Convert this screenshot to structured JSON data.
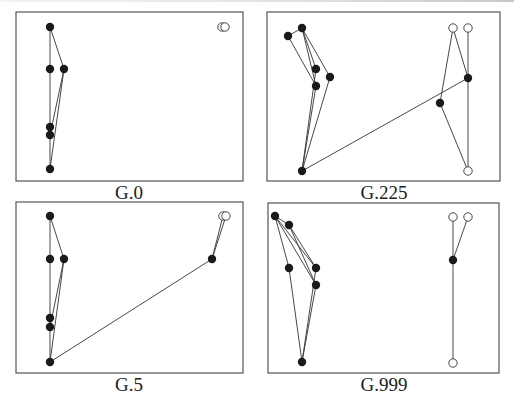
{
  "figure": {
    "panels": [
      {
        "id": "g0",
        "label": "G.0",
        "frame": [
          16,
          12,
          243,
          181
        ],
        "label_pos": [
          69,
          182
        ],
        "filled_nodes": [
          [
            50,
            27
          ],
          [
            50,
            69
          ],
          [
            64,
            69
          ],
          [
            50,
            127
          ],
          [
            50,
            135
          ],
          [
            50,
            169
          ]
        ],
        "open_nodes": [
          [
            222,
            27
          ],
          [
            225,
            27
          ]
        ],
        "edges": [
          [
            [
              50,
              27
            ],
            [
              50,
              69
            ]
          ],
          [
            [
              50,
              69
            ],
            [
              50,
              127
            ]
          ],
          [
            [
              50,
              127
            ],
            [
              50,
              135
            ]
          ],
          [
            [
              50,
              135
            ],
            [
              50,
              169
            ]
          ],
          [
            [
              50,
              27
            ],
            [
              64,
              69
            ]
          ],
          [
            [
              64,
              69
            ],
            [
              50,
              135
            ]
          ],
          [
            [
              64,
              69
            ],
            [
              50,
              169
            ]
          ]
        ]
      },
      {
        "id": "g225",
        "label": "G.225",
        "frame": [
          267,
          12,
          500,
          181
        ],
        "label_pos": [
          324,
          182
        ],
        "filled_nodes": [
          [
            302,
            28
          ],
          [
            288,
            36
          ],
          [
            316,
            69
          ],
          [
            330,
            77
          ],
          [
            316,
            86
          ],
          [
            302,
            171
          ],
          [
            468,
            78
          ],
          [
            440,
            103
          ]
        ],
        "open_nodes": [
          [
            453,
            28
          ],
          [
            468,
            28
          ],
          [
            468,
            171
          ]
        ],
        "edges": [
          [
            [
              302,
              28
            ],
            [
              288,
              36
            ]
          ],
          [
            [
              288,
              36
            ],
            [
              316,
              86
            ]
          ],
          [
            [
              302,
              28
            ],
            [
              316,
              69
            ]
          ],
          [
            [
              302,
              28
            ],
            [
              316,
              86
            ]
          ],
          [
            [
              302,
              28
            ],
            [
              330,
              77
            ]
          ],
          [
            [
              316,
              69
            ],
            [
              302,
              171
            ]
          ],
          [
            [
              316,
              86
            ],
            [
              302,
              171
            ]
          ],
          [
            [
              330,
              77
            ],
            [
              302,
              171
            ]
          ],
          [
            [
              302,
              171
            ],
            [
              468,
              78
            ]
          ],
          [
            [
              453,
              28
            ],
            [
              468,
              78
            ]
          ],
          [
            [
              453,
              28
            ],
            [
              440,
              103
            ]
          ],
          [
            [
              468,
              28
            ],
            [
              468,
              171
            ]
          ],
          [
            [
              440,
              103
            ],
            [
              468,
              171
            ]
          ]
        ]
      },
      {
        "id": "g5",
        "label": "G.5",
        "frame": [
          16,
          202,
          243,
          373
        ],
        "label_pos": [
          69,
          374
        ],
        "filled_nodes": [
          [
            50,
            216
          ],
          [
            50,
            259
          ],
          [
            64,
            259
          ],
          [
            50,
            318
          ],
          [
            50,
            327
          ],
          [
            50,
            362
          ],
          [
            212,
            259
          ]
        ],
        "open_nodes": [
          [
            223,
            216
          ],
          [
            226,
            216
          ]
        ],
        "edges": [
          [
            [
              50,
              216
            ],
            [
              50,
              259
            ]
          ],
          [
            [
              50,
              259
            ],
            [
              50,
              318
            ]
          ],
          [
            [
              50,
              318
            ],
            [
              50,
              327
            ]
          ],
          [
            [
              50,
              327
            ],
            [
              50,
              362
            ]
          ],
          [
            [
              50,
              216
            ],
            [
              64,
              259
            ]
          ],
          [
            [
              64,
              259
            ],
            [
              50,
              327
            ]
          ],
          [
            [
              64,
              259
            ],
            [
              50,
              362
            ]
          ],
          [
            [
              50,
              362
            ],
            [
              212,
              259
            ]
          ],
          [
            [
              212,
              259
            ],
            [
              223,
              216
            ]
          ],
          [
            [
              212,
              259
            ],
            [
              226,
              216
            ]
          ]
        ]
      },
      {
        "id": "g999",
        "label": "G.999",
        "frame": [
          268,
          203,
          499,
          373
        ],
        "label_pos": [
          324,
          374
        ],
        "filled_nodes": [
          [
            275,
            216
          ],
          [
            289,
            225
          ],
          [
            289,
            268
          ],
          [
            316,
            268
          ],
          [
            316,
            285
          ],
          [
            302,
            362
          ],
          [
            453,
            260
          ]
        ],
        "open_nodes": [
          [
            453,
            217
          ],
          [
            468,
            217
          ],
          [
            453,
            363
          ]
        ],
        "edges": [
          [
            [
              275,
              216
            ],
            [
              289,
              225
            ]
          ],
          [
            [
              275,
              216
            ],
            [
              289,
              268
            ]
          ],
          [
            [
              275,
              216
            ],
            [
              316,
              268
            ]
          ],
          [
            [
              275,
              216
            ],
            [
              316,
              285
            ]
          ],
          [
            [
              289,
              225
            ],
            [
              316,
              268
            ]
          ],
          [
            [
              289,
              225
            ],
            [
              316,
              285
            ]
          ],
          [
            [
              289,
              268
            ],
            [
              302,
              362
            ]
          ],
          [
            [
              316,
              268
            ],
            [
              302,
              362
            ]
          ],
          [
            [
              316,
              285
            ],
            [
              302,
              362
            ]
          ],
          [
            [
              453,
              217
            ],
            [
              453,
              260
            ]
          ],
          [
            [
              468,
              217
            ],
            [
              453,
              260
            ]
          ],
          [
            [
              453,
              260
            ],
            [
              453,
              363
            ]
          ]
        ]
      }
    ],
    "node_radius": 4.2,
    "colors": {
      "frame": "#555555",
      "edge": "#333333",
      "filled": "#1a1a1a",
      "open_fill": "#ffffff"
    }
  }
}
